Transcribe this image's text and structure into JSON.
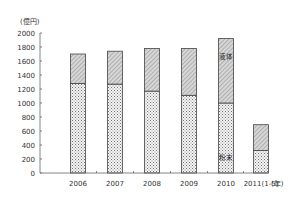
{
  "chart_data": {
    "type": "bar",
    "stacked": true,
    "title": "",
    "xlabel": "(年)",
    "ylabel": "(億円)",
    "ylim": [
      0,
      2000
    ],
    "yticks": [
      0,
      200,
      400,
      600,
      800,
      1000,
      1200,
      1400,
      1600,
      1800,
      2000
    ],
    "categories": [
      "2006",
      "2007",
      "2008",
      "2009",
      "2010",
      "2011(1-5)"
    ],
    "series": [
      {
        "name": "粉末",
        "values": [
          1280,
          1270,
          1170,
          1110,
          1000,
          320
        ],
        "pattern": "dots"
      },
      {
        "name": "液体",
        "values": [
          420,
          470,
          610,
          670,
          920,
          370
        ],
        "pattern": "diagonal"
      }
    ],
    "totals": [
      1700,
      1740,
      1780,
      1780,
      1920,
      690
    ],
    "annotations": [
      {
        "text": "液体",
        "category": "2010",
        "series": "液体"
      },
      {
        "text": "粉末",
        "category": "2010",
        "series": "粉末"
      }
    ],
    "grid": false,
    "legend": "inline labels in 2010 bar"
  }
}
